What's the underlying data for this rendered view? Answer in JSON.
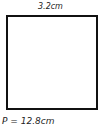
{
  "diagram": {
    "shape": "square",
    "side_label": "3.2cm",
    "perimeter_label": "P = 12.8cm",
    "colors": {
      "stroke": "#111111",
      "text": "#222222",
      "background": "#ffffff"
    }
  }
}
